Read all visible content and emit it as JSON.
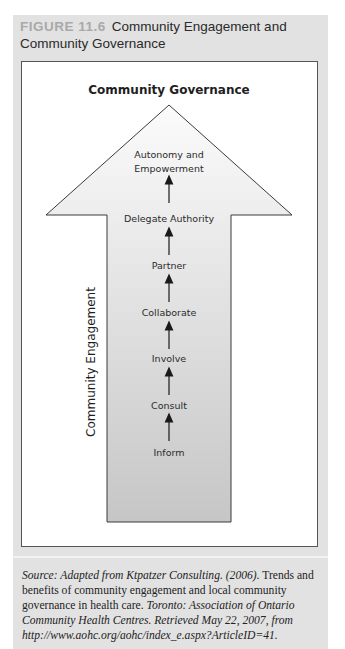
{
  "figure": {
    "number": "FIGURE 11.6",
    "title": "Community Engagement and Community Governance"
  },
  "diagram": {
    "top_label": "Community Governance",
    "side_label": "Community Engagement",
    "steps": [
      {
        "label_line1": "Autonomy and",
        "label_line2": "Empowerment"
      },
      {
        "label_line1": "Delegate Authority"
      },
      {
        "label_line1": "Partner"
      },
      {
        "label_line1": "Collaborate"
      },
      {
        "label_line1": "Involve"
      },
      {
        "label_line1": "Consult"
      },
      {
        "label_line1": "Inform"
      }
    ],
    "colors": {
      "arrow_top": "#fbfbfb",
      "arrow_bottom": "#c6c6c6",
      "panel": "#e2e2e2",
      "figure_number": "#a9a9a9"
    }
  },
  "source": {
    "italic_1": "Source: Adapted from Ktpatzer Consulting. (2006).",
    "roman_1": " Trends and benefits of community engagement and local community governance in health care. ",
    "italic_2": "Toronto: Association of Ontario Community Health Centres. Retrieved May 22, 2007, from http://www.aohc.org/aohc/index_e.aspx?ArticleID=41."
  }
}
